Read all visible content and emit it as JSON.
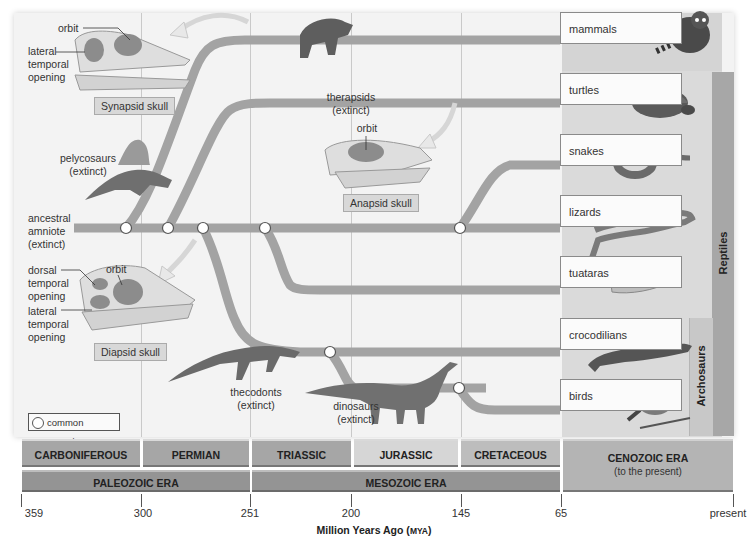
{
  "figure": {
    "type": "phylogenetic-tree",
    "axis_title": "Million Years Ago",
    "axis_unit": "MYA",
    "axis_ticks": [
      {
        "label": "359",
        "x": 21
      },
      {
        "label": "300",
        "x": 141
      },
      {
        "label": "251",
        "x": 250
      },
      {
        "label": "200",
        "x": 351
      },
      {
        "label": "145",
        "x": 461
      },
      {
        "label": "65",
        "x": 561
      },
      {
        "label": "present",
        "x": 733
      }
    ]
  },
  "periods": [
    {
      "label": "CARBONIFEROUS",
      "x": 22,
      "w": 118,
      "color": "#a6a6a6"
    },
    {
      "label": "PERMIAN",
      "x": 143,
      "w": 106,
      "color": "#a6a6a6"
    },
    {
      "label": "TRIASSIC",
      "x": 252,
      "w": 99,
      "color": "#a6a6a6"
    },
    {
      "label": "JURASSIC",
      "x": 354,
      "w": 104,
      "color": "#d6d6d6"
    },
    {
      "label": "CRETACEOUS",
      "x": 461,
      "w": 99,
      "color": "#bdbdbd"
    }
  ],
  "eras": [
    {
      "label": "PALEOZOIC ERA",
      "x": 22,
      "w": 228,
      "color": "#949494"
    },
    {
      "label": "MESOZOIC ERA",
      "x": 252,
      "w": 308,
      "color": "#949494"
    }
  ],
  "cenozoic": {
    "label": "CENOZOIC ERA",
    "sublabel": "(to the present)",
    "color": "#b4b4b4"
  },
  "groups": {
    "reptiles": "Reptiles",
    "archosaurs": "Archosaurs"
  },
  "living_taxa": [
    {
      "label": "mammals",
      "y": 12,
      "animal": "raccoon"
    },
    {
      "label": "turtles",
      "y": 73,
      "animal": "turtle"
    },
    {
      "label": "snakes",
      "y": 134,
      "animal": "snake"
    },
    {
      "label": "lizards",
      "y": 195,
      "animal": "lizard"
    },
    {
      "label": "tuataras",
      "y": 256,
      "animal": "tuatara"
    },
    {
      "label": "crocodilians",
      "y": 318,
      "animal": "crocodile"
    },
    {
      "label": "birds",
      "y": 379,
      "animal": "bird"
    }
  ],
  "extinct_labels": {
    "therapsids": [
      "therapsids",
      "(extinct)"
    ],
    "pelycosaurs": [
      "pelycosaurs",
      "(extinct)"
    ],
    "ancestral": [
      "ancestral",
      "amniote",
      "(extinct)"
    ],
    "thecodonts": [
      "thecodonts",
      "(extinct)"
    ],
    "dinosaurs": [
      "dinosaurs",
      "(extinct)"
    ]
  },
  "skulls": {
    "synapsid": {
      "tag": "Synapsid skull",
      "orbit": "orbit",
      "lateral": [
        "lateral",
        "temporal",
        "opening"
      ]
    },
    "anapsid": {
      "tag": "Anapsid skull",
      "orbit": "orbit"
    },
    "diapsid": {
      "tag": "Diapsid skull",
      "orbit": "orbit",
      "dorsal": [
        "dorsal",
        "temporal",
        "opening"
      ],
      "lateral": [
        "lateral",
        "temporal",
        "opening"
      ]
    }
  },
  "legend": {
    "label": "common ancestor"
  },
  "colors": {
    "branch": "#a3a3a3",
    "node_fill": "#ffffff",
    "panel": "#f3f3f3",
    "arrow": "#e6e6e6"
  }
}
